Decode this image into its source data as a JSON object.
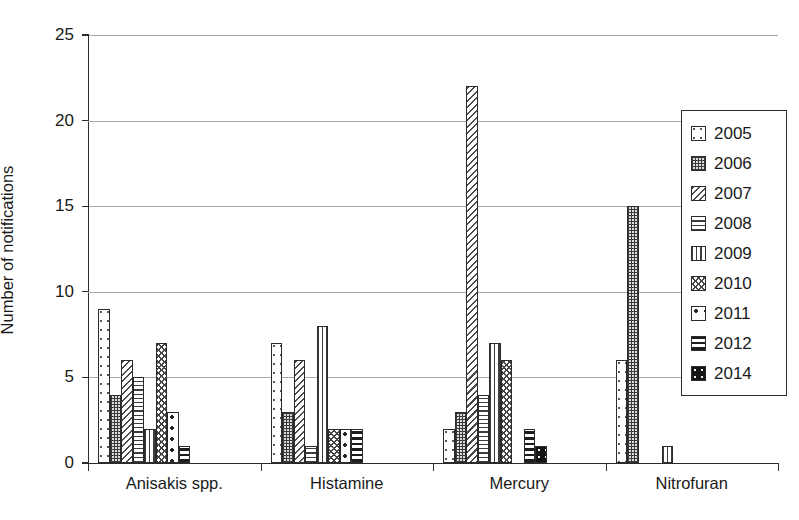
{
  "chart_data": {
    "type": "bar",
    "title": "",
    "xlabel": "",
    "ylabel": "Number of notifications",
    "ylim": [
      0,
      25
    ],
    "yticks": [
      0,
      5,
      10,
      15,
      20,
      25
    ],
    "grid": true,
    "legend_position": "right",
    "categories": [
      "Anisakis spp.",
      "Histamine",
      "Mercury",
      "Nitrofuran"
    ],
    "series": [
      {
        "name": "2005",
        "values": [
          9,
          7,
          2,
          6
        ]
      },
      {
        "name": "2006",
        "values": [
          4,
          3,
          3,
          15
        ]
      },
      {
        "name": "2007",
        "values": [
          6,
          6,
          22,
          0
        ]
      },
      {
        "name": "2008",
        "values": [
          5,
          1,
          4,
          0
        ]
      },
      {
        "name": "2009",
        "values": [
          2,
          8,
          7,
          1
        ]
      },
      {
        "name": "2010",
        "values": [
          7,
          2,
          6,
          0
        ]
      },
      {
        "name": "2011",
        "values": [
          3,
          2,
          0,
          0
        ]
      },
      {
        "name": "2012",
        "values": [
          1,
          2,
          2,
          0
        ]
      },
      {
        "name": "2014",
        "values": [
          0,
          0,
          1,
          0
        ]
      }
    ]
  },
  "legend": {
    "entries": [
      {
        "label": "2005",
        "pattern": "sparse-dots"
      },
      {
        "label": "2006",
        "pattern": "dense-checker"
      },
      {
        "label": "2007",
        "pattern": "diagonal-hatch"
      },
      {
        "label": "2008",
        "pattern": "horizontal-lines"
      },
      {
        "label": "2009",
        "pattern": "vertical-lines"
      },
      {
        "label": "2010",
        "pattern": "cross-wave"
      },
      {
        "label": "2011",
        "pattern": "large-dots"
      },
      {
        "label": "2012",
        "pattern": "thick-bands"
      },
      {
        "label": "2014",
        "pattern": "dark-dots"
      }
    ]
  },
  "axis": {
    "y_title": "Number of notifications",
    "y_tick_labels": [
      "25",
      "20",
      "15",
      "10",
      "5",
      "0"
    ],
    "x_tick_labels": [
      "Anisakis spp.",
      "Histamine",
      "Mercury",
      "Nitrofuran"
    ]
  },
  "colors": {
    "axis": "#2b2b2b",
    "grid": "#a8a8a8",
    "text": "#1a1a1a",
    "background": "#ffffff"
  }
}
